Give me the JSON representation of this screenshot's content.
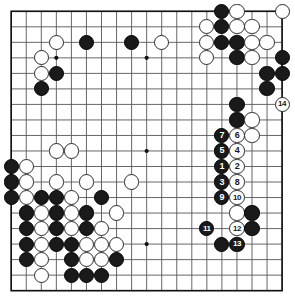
{
  "board": {
    "name": "go-board",
    "size": 19,
    "geometry": {
      "origin_x": 11.2,
      "origin_y": 11.3,
      "step_x": 15.05,
      "step_y": 15.52,
      "stone_diameter": 15.2,
      "border_width": 1.6,
      "line_width": 0.9
    },
    "colors": {
      "background": "#ffffff",
      "line": "#55565a",
      "border": "#111111",
      "black_stone": "#1a1a1a",
      "white_stone": "#ffffff",
      "white_stone_border": "#2b2b2b",
      "black_label": "#ffffff",
      "white_label": "#1a1a1a"
    },
    "star_points": [
      {
        "col": 4,
        "row": 4
      },
      {
        "col": 10,
        "row": 4
      },
      {
        "col": 16,
        "row": 4
      },
      {
        "col": 4,
        "row": 10
      },
      {
        "col": 10,
        "row": 10
      },
      {
        "col": 16,
        "row": 10
      },
      {
        "col": 4,
        "row": 16
      },
      {
        "col": 10,
        "row": 16
      },
      {
        "col": 16,
        "row": 16
      }
    ],
    "stones": [
      {
        "col": 15,
        "row": 1,
        "color": "black"
      },
      {
        "col": 16,
        "row": 1,
        "color": "white"
      },
      {
        "col": 19,
        "row": 1,
        "color": "white"
      },
      {
        "col": 14,
        "row": 2,
        "color": "white"
      },
      {
        "col": 15,
        "row": 2,
        "color": "black"
      },
      {
        "col": 16,
        "row": 2,
        "color": "white"
      },
      {
        "col": 17,
        "row": 2,
        "color": "white"
      },
      {
        "col": 4,
        "row": 3,
        "color": "white"
      },
      {
        "col": 6,
        "row": 3,
        "color": "black"
      },
      {
        "col": 9,
        "row": 3,
        "color": "black"
      },
      {
        "col": 11,
        "row": 3,
        "color": "white"
      },
      {
        "col": 14,
        "row": 3,
        "color": "white"
      },
      {
        "col": 15,
        "row": 3,
        "color": "black"
      },
      {
        "col": 16,
        "row": 3,
        "color": "black"
      },
      {
        "col": 17,
        "row": 3,
        "color": "white"
      },
      {
        "col": 18,
        "row": 3,
        "color": "white"
      },
      {
        "col": 3,
        "row": 4,
        "color": "white"
      },
      {
        "col": 14,
        "row": 4,
        "color": "white"
      },
      {
        "col": 16,
        "row": 4,
        "color": "black"
      },
      {
        "col": 17,
        "row": 4,
        "color": "white"
      },
      {
        "col": 19,
        "row": 4,
        "color": "black"
      },
      {
        "col": 3,
        "row": 5,
        "color": "white"
      },
      {
        "col": 4,
        "row": 5,
        "color": "black"
      },
      {
        "col": 18,
        "row": 5,
        "color": "black"
      },
      {
        "col": 19,
        "row": 5,
        "color": "black"
      },
      {
        "col": 3,
        "row": 6,
        "color": "black"
      },
      {
        "col": 18,
        "row": 6,
        "color": "black"
      },
      {
        "col": 16,
        "row": 7,
        "color": "black"
      },
      {
        "col": 19,
        "row": 7,
        "color": "white",
        "label": "14"
      },
      {
        "col": 16,
        "row": 8,
        "color": "black"
      },
      {
        "col": 17,
        "row": 8,
        "color": "white"
      },
      {
        "col": 15,
        "row": 9,
        "color": "black",
        "label": "7"
      },
      {
        "col": 16,
        "row": 9,
        "color": "white",
        "label": "6"
      },
      {
        "col": 17,
        "row": 9,
        "color": "white"
      },
      {
        "col": 4,
        "row": 10,
        "color": "white"
      },
      {
        "col": 5,
        "row": 10,
        "color": "white"
      },
      {
        "col": 15,
        "row": 10,
        "color": "black",
        "label": "5"
      },
      {
        "col": 16,
        "row": 10,
        "color": "white",
        "label": "4"
      },
      {
        "col": 1,
        "row": 11,
        "color": "black"
      },
      {
        "col": 2,
        "row": 11,
        "color": "white"
      },
      {
        "col": 15,
        "row": 11,
        "color": "black",
        "label": "1"
      },
      {
        "col": 16,
        "row": 11,
        "color": "white",
        "label": "2"
      },
      {
        "col": 1,
        "row": 12,
        "color": "black"
      },
      {
        "col": 2,
        "row": 12,
        "color": "white"
      },
      {
        "col": 4,
        "row": 12,
        "color": "white"
      },
      {
        "col": 6,
        "row": 12,
        "color": "white"
      },
      {
        "col": 9,
        "row": 12,
        "color": "white"
      },
      {
        "col": 15,
        "row": 12,
        "color": "black",
        "label": "3"
      },
      {
        "col": 16,
        "row": 12,
        "color": "white",
        "label": "8"
      },
      {
        "col": 1,
        "row": 13,
        "color": "black"
      },
      {
        "col": 2,
        "row": 13,
        "color": "white"
      },
      {
        "col": 3,
        "row": 13,
        "color": "black"
      },
      {
        "col": 4,
        "row": 13,
        "color": "black"
      },
      {
        "col": 5,
        "row": 13,
        "color": "white"
      },
      {
        "col": 7,
        "row": 13,
        "color": "black"
      },
      {
        "col": 15,
        "row": 13,
        "color": "black",
        "label": "9"
      },
      {
        "col": 16,
        "row": 13,
        "color": "white",
        "label": "10"
      },
      {
        "col": 2,
        "row": 14,
        "color": "black"
      },
      {
        "col": 3,
        "row": 14,
        "color": "white"
      },
      {
        "col": 4,
        "row": 14,
        "color": "black"
      },
      {
        "col": 5,
        "row": 14,
        "color": "white"
      },
      {
        "col": 6,
        "row": 14,
        "color": "black"
      },
      {
        "col": 8,
        "row": 14,
        "color": "white"
      },
      {
        "col": 16,
        "row": 14,
        "color": "white"
      },
      {
        "col": 17,
        "row": 14,
        "color": "black"
      },
      {
        "col": 2,
        "row": 15,
        "color": "black"
      },
      {
        "col": 3,
        "row": 15,
        "color": "white"
      },
      {
        "col": 4,
        "row": 15,
        "color": "black"
      },
      {
        "col": 5,
        "row": 15,
        "color": "white"
      },
      {
        "col": 6,
        "row": 15,
        "color": "black"
      },
      {
        "col": 7,
        "row": 15,
        "color": "white"
      },
      {
        "col": 14,
        "row": 15,
        "color": "black",
        "label": "11"
      },
      {
        "col": 16,
        "row": 15,
        "color": "white",
        "label": "12"
      },
      {
        "col": 17,
        "row": 15,
        "color": "black"
      },
      {
        "col": 2,
        "row": 16,
        "color": "black"
      },
      {
        "col": 3,
        "row": 16,
        "color": "white"
      },
      {
        "col": 4,
        "row": 16,
        "color": "black"
      },
      {
        "col": 5,
        "row": 16,
        "color": "black"
      },
      {
        "col": 6,
        "row": 16,
        "color": "white"
      },
      {
        "col": 7,
        "row": 16,
        "color": "white"
      },
      {
        "col": 8,
        "row": 16,
        "color": "white"
      },
      {
        "col": 15,
        "row": 16,
        "color": "black"
      },
      {
        "col": 16,
        "row": 16,
        "color": "black",
        "label": "13"
      },
      {
        "col": 2,
        "row": 17,
        "color": "black"
      },
      {
        "col": 3,
        "row": 17,
        "color": "white"
      },
      {
        "col": 5,
        "row": 17,
        "color": "black"
      },
      {
        "col": 6,
        "row": 17,
        "color": "white"
      },
      {
        "col": 7,
        "row": 17,
        "color": "white"
      },
      {
        "col": 8,
        "row": 17,
        "color": "black"
      },
      {
        "col": 3,
        "row": 18,
        "color": "white"
      },
      {
        "col": 5,
        "row": 18,
        "color": "black"
      },
      {
        "col": 6,
        "row": 18,
        "color": "black"
      },
      {
        "col": 7,
        "row": 18,
        "color": "black"
      }
    ]
  }
}
